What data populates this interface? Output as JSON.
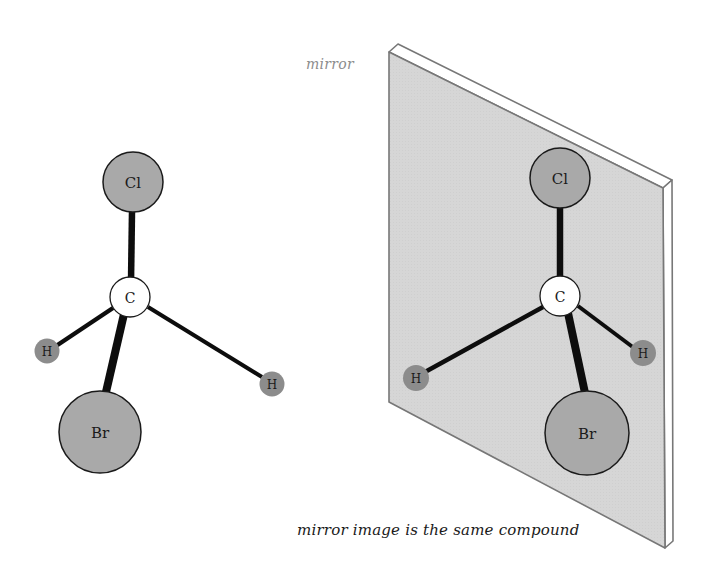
{
  "labels": {
    "mirror": "mirror",
    "caption": "mirror image is the same compound"
  },
  "colors": {
    "plate_face": "#d6d6d6",
    "plate_edge": "#ffffff",
    "plate_stroke": "#777777",
    "halogen_fill": "#a9a9a9",
    "hydrogen_fill": "#8c8c8c",
    "carbon_fill": "#ffffff",
    "bond": "#0d0d0d"
  },
  "molecules": [
    {
      "name": "original",
      "atoms": [
        {
          "id": "Cl",
          "label": "Cl"
        },
        {
          "id": "C",
          "label": "C"
        },
        {
          "id": "H1",
          "label": "H"
        },
        {
          "id": "H2",
          "label": "H"
        },
        {
          "id": "Br",
          "label": "Br"
        }
      ]
    },
    {
      "name": "mirror-image",
      "atoms": [
        {
          "id": "Cl",
          "label": "Cl"
        },
        {
          "id": "C",
          "label": "C"
        },
        {
          "id": "H1",
          "label": "H"
        },
        {
          "id": "H2",
          "label": "H"
        },
        {
          "id": "Br",
          "label": "Br"
        }
      ]
    }
  ]
}
